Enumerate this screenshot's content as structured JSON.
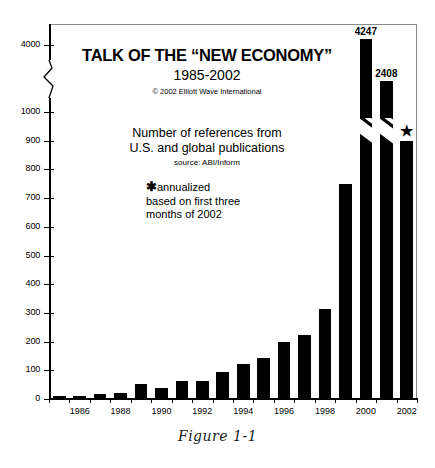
{
  "figure": {
    "caption": "Figure 1-1"
  },
  "chart_data": {
    "type": "bar",
    "title": "TALK OF THE “NEW ECONOMY”",
    "subtitle": "1985-2002",
    "copyright": "© 2002 Elliott Wave International",
    "description_line1": "Number of references from",
    "description_line2": "U.S. and global publications",
    "source": "source: ABI/Inform",
    "note_line1": "annualized",
    "note_line2": "based on first three",
    "note_line3": "months of 2002",
    "note_marker": "★",
    "xlabel": "",
    "ylabel": "",
    "grid": false,
    "legend": "none",
    "axis_break": true,
    "axis_break_between": [
      1000,
      4000
    ],
    "ylim": [
      0,
      4400
    ],
    "ytick_labels": [
      "0",
      "100",
      "200",
      "300",
      "400",
      "500",
      "600",
      "700",
      "800",
      "900",
      "1000",
      "4000"
    ],
    "yticks": [
      0,
      100,
      200,
      300,
      400,
      500,
      600,
      700,
      800,
      900,
      1000,
      4000
    ],
    "xtick_labels": [
      "1986",
      "1988",
      "1990",
      "1992",
      "1994",
      "1996",
      "1998",
      "2000",
      "2002"
    ],
    "categories": [
      "1985",
      "1986",
      "1987",
      "1988",
      "1989",
      "1990",
      "1991",
      "1992",
      "1993",
      "1994",
      "1995",
      "1996",
      "1997",
      "1998",
      "1999",
      "2000",
      "2001",
      "2002"
    ],
    "values": [
      10,
      12,
      18,
      20,
      52,
      40,
      62,
      62,
      93,
      122,
      143,
      200,
      222,
      315,
      750,
      4247,
      2408,
      900
    ],
    "data_labels": {
      "2000": "4247",
      "2001": "2408",
      "2002": "*"
    },
    "annotations": [
      {
        "label": "4247",
        "category": "2000"
      },
      {
        "label": "2408",
        "category": "2001"
      },
      {
        "label": "*",
        "category": "2002"
      }
    ],
    "bar_color": "#000000",
    "background_color": "#ffffff"
  }
}
